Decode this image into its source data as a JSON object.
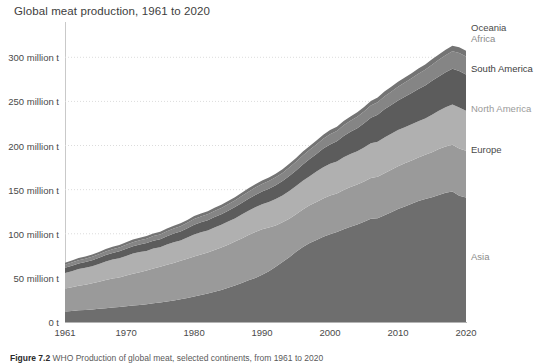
{
  "chart_data": {
    "type": "area",
    "stacked": true,
    "title": "Global meat production, 1961 to 2020",
    "xlabel": "",
    "ylabel": "",
    "xlim": [
      1961,
      2020
    ],
    "ylim": [
      0,
      340
    ],
    "y_unit": "million t",
    "grid": true,
    "grid_axis": "y",
    "legend_position": "right-inline",
    "x": [
      1961,
      1962,
      1963,
      1964,
      1965,
      1966,
      1967,
      1968,
      1969,
      1970,
      1971,
      1972,
      1973,
      1974,
      1975,
      1976,
      1977,
      1978,
      1979,
      1980,
      1981,
      1982,
      1983,
      1984,
      1985,
      1986,
      1987,
      1988,
      1989,
      1990,
      1991,
      1992,
      1993,
      1994,
      1995,
      1996,
      1997,
      1998,
      1999,
      2000,
      2001,
      2002,
      2003,
      2004,
      2005,
      2006,
      2007,
      2008,
      2009,
      2010,
      2011,
      2012,
      2013,
      2014,
      2015,
      2016,
      2017,
      2018,
      2019,
      2020
    ],
    "x_ticks": [
      1961,
      1970,
      1980,
      1990,
      2000,
      2010,
      2020
    ],
    "x_tick_labels": [
      "1961",
      "1970",
      "1980",
      "1990",
      "2000",
      "2010",
      "2020"
    ],
    "y_ticks": [
      0,
      50,
      100,
      150,
      200,
      250,
      300
    ],
    "y_tick_labels": [
      "0 t",
      "50 million t",
      "100 million t",
      "150 million t",
      "200 million t",
      "250 million t",
      "300 million t"
    ],
    "series": [
      {
        "name": "Asia",
        "color": "#6e6e6e",
        "label_color": "#8a8a8a",
        "values": [
          12.0,
          12.5,
          13.2,
          13.6,
          14.3,
          15.0,
          15.7,
          16.4,
          17.0,
          17.8,
          18.6,
          19.4,
          20.1,
          21.2,
          22.1,
          23.3,
          24.4,
          25.8,
          27.3,
          28.8,
          30.5,
          32.3,
          34.2,
          36.3,
          38.8,
          41.3,
          44.2,
          47.2,
          50.0,
          53.5,
          57.5,
          62.5,
          68.0,
          73.5,
          79.5,
          85.0,
          89.5,
          93.0,
          96.5,
          99.5,
          102.0,
          105.0,
          108.0,
          110.5,
          113.5,
          117.0,
          117.5,
          121.0,
          124.5,
          128.0,
          131.0,
          134.0,
          137.0,
          139.5,
          141.5,
          144.0,
          146.5,
          148.0,
          143.0,
          141.0
        ]
      },
      {
        "name": "Europe",
        "color": "#9a9a9a",
        "label_color": "#4a4a4a",
        "values": [
          26.0,
          27.0,
          28.0,
          28.5,
          29.5,
          30.5,
          31.8,
          32.8,
          33.5,
          34.8,
          36.0,
          37.0,
          38.2,
          39.5,
          40.5,
          41.5,
          42.5,
          43.5,
          44.5,
          45.5,
          46.0,
          46.5,
          47.5,
          48.0,
          48.8,
          49.8,
          50.5,
          51.5,
          52.0,
          51.5,
          49.5,
          47.0,
          45.0,
          43.5,
          42.5,
          42.5,
          42.8,
          43.0,
          43.5,
          43.8,
          43.5,
          44.5,
          45.0,
          45.3,
          45.8,
          46.3,
          47.0,
          47.5,
          48.0,
          48.5,
          48.8,
          49.0,
          49.3,
          50.0,
          51.0,
          52.0,
          52.5,
          53.0,
          53.5,
          53.0
        ]
      },
      {
        "name": "North America",
        "color": "#b0b0b0",
        "label_color": "#9a9a9a",
        "values": [
          17.5,
          18.0,
          18.8,
          19.3,
          19.5,
          20.2,
          21.0,
          21.5,
          21.8,
          22.3,
          23.0,
          22.8,
          22.3,
          22.5,
          22.0,
          23.0,
          23.5,
          23.2,
          24.0,
          25.0,
          25.3,
          25.0,
          25.5,
          25.8,
          26.3,
          26.3,
          27.0,
          27.5,
          28.0,
          28.5,
          29.0,
          30.0,
          30.5,
          31.5,
          32.0,
          32.5,
          33.0,
          34.5,
          35.5,
          36.0,
          36.3,
          37.3,
          37.5,
          37.8,
          38.5,
          39.3,
          39.8,
          40.5,
          40.8,
          41.0,
          41.0,
          41.0,
          41.3,
          41.0,
          42.3,
          43.5,
          44.5,
          45.5,
          46.5,
          45.5
        ]
      },
      {
        "name": "South America",
        "color": "#5c5c5c",
        "label_color": "#3d3d3d",
        "values": [
          6.0,
          6.2,
          6.3,
          6.5,
          6.8,
          7.0,
          7.3,
          7.5,
          7.8,
          8.0,
          8.2,
          8.5,
          8.8,
          9.0,
          9.2,
          9.5,
          9.8,
          10.2,
          10.5,
          11.0,
          11.3,
          11.5,
          11.8,
          12.0,
          12.3,
          12.8,
          13.2,
          13.5,
          14.0,
          14.5,
          15.0,
          15.5,
          16.2,
          17.0,
          17.8,
          18.5,
          19.3,
          20.0,
          21.0,
          22.0,
          23.0,
          24.0,
          25.0,
          26.0,
          27.5,
          29.0,
          30.5,
          32.0,
          32.5,
          33.5,
          34.5,
          35.5,
          36.5,
          37.5,
          38.5,
          38.8,
          39.5,
          40.5,
          41.5,
          41.0
        ]
      },
      {
        "name": "Africa",
        "color": "#858585",
        "label_color": "#8a8a8a",
        "values": [
          3.5,
          3.6,
          3.7,
          3.8,
          3.9,
          4.0,
          4.2,
          4.3,
          4.4,
          4.6,
          4.7,
          4.9,
          5.0,
          5.2,
          5.3,
          5.5,
          5.7,
          5.9,
          6.1,
          6.3,
          6.5,
          6.7,
          6.9,
          7.1,
          7.3,
          7.5,
          7.8,
          8.0,
          8.3,
          8.5,
          8.8,
          9.0,
          9.3,
          9.6,
          9.9,
          10.2,
          10.5,
          10.8,
          11.1,
          11.5,
          11.8,
          12.2,
          12.6,
          13.0,
          13.4,
          13.8,
          14.2,
          14.7,
          15.2,
          15.7,
          16.2,
          16.7,
          17.2,
          17.8,
          18.3,
          18.8,
          19.3,
          19.8,
          20.3,
          20.5
        ]
      },
      {
        "name": "Oceania",
        "color": "#747474",
        "label_color": "#4a4a4a",
        "values": [
          2.2,
          2.3,
          2.4,
          2.4,
          2.5,
          2.5,
          2.6,
          2.7,
          2.7,
          2.8,
          2.9,
          2.9,
          3.0,
          3.0,
          3.1,
          3.2,
          3.2,
          3.3,
          3.3,
          3.4,
          3.4,
          3.5,
          3.5,
          3.6,
          3.6,
          3.7,
          3.8,
          3.8,
          3.9,
          4.0,
          4.0,
          4.1,
          4.2,
          4.2,
          4.3,
          4.4,
          4.4,
          4.5,
          4.6,
          4.7,
          4.7,
          4.8,
          4.9,
          5.0,
          5.1,
          5.2,
          5.3,
          5.4,
          5.5,
          5.6,
          5.7,
          5.8,
          5.9,
          6.0,
          6.1,
          6.2,
          6.3,
          6.4,
          6.5,
          6.5
        ]
      }
    ]
  },
  "caption": {
    "figure_number": "Figure 7.2",
    "text": "WHO Production of global meat, selected continents, from 1961 to 2020"
  }
}
